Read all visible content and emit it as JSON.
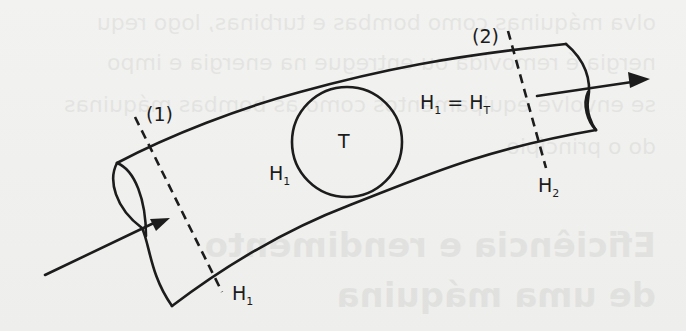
{
  "figure": {
    "labels": {
      "section1": "(1)",
      "section2": "(2)",
      "turbine": "T",
      "energy_left": {
        "main": "H",
        "sub": "1"
      },
      "energy_section1": {
        "main": "H",
        "sub": "1"
      },
      "energy_section2": {
        "main": "H",
        "sub": "2"
      },
      "equation": {
        "lhs": "H",
        "lhs_sub": "1",
        "eq": " = ",
        "rhs": "H",
        "rhs_sub": "T"
      }
    },
    "elements": {
      "pipe": "curved-pipe",
      "inlet_arrow": "flow-in-arrow",
      "outlet_arrow": "flow-out-arrow",
      "machine": "turbine-circle",
      "sections": [
        "section-1-dashed",
        "section-2-dashed"
      ]
    },
    "colors": {
      "ink": "#1c1c1c",
      "paper": "#f0f0ee"
    }
  },
  "bleed_through": {
    "lines": [
      "olva máquinas como bombas e turbinas, logo requ",
      "nergia é removida ou entregue na energia e impo",
      "se envolve equipamentos como as bombas máquinas",
      "do o princípio",
      "Eficiência e rendimento",
      "de uma máquina"
    ]
  }
}
